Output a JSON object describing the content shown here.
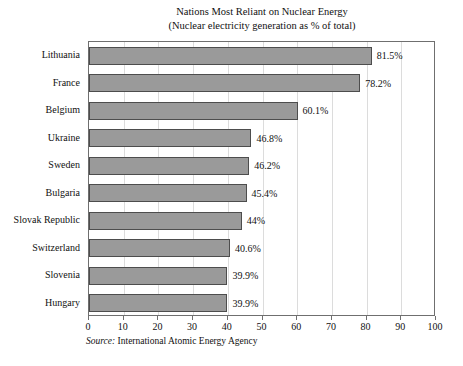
{
  "chart_data": {
    "type": "bar",
    "orientation": "horizontal",
    "title": "Nations Most Reliant on Nuclear Energy",
    "subtitle": "(Nuclear electricity generation as % of total)",
    "xlabel": "",
    "ylabel": "",
    "xlim": [
      0,
      100
    ],
    "xticks": [
      "0",
      "10",
      "20",
      "30",
      "40",
      "50",
      "60",
      "70",
      "80",
      "90",
      "100"
    ],
    "grid": true,
    "grid_axis": "x",
    "legend": false,
    "bar_color": "#9a9a9a",
    "bar_border_color": "#4d4d4d",
    "categories": [
      "Lithuania",
      "France",
      "Belgium",
      "Ukraine",
      "Sweden",
      "Bulgaria",
      "Slovak Republic",
      "Switzerland",
      "Slovenia",
      "Hungary"
    ],
    "values": [
      81.5,
      78.2,
      60.1,
      46.8,
      46.2,
      45.4,
      44,
      40.6,
      39.9,
      39.9
    ],
    "data_labels": [
      "81.5%",
      "78.2%",
      "60.1%",
      "46.8%",
      "46.2%",
      "45.4%",
      "44%",
      "40.6%",
      "39.9%",
      "39.9%"
    ],
    "source_label": "Source:",
    "source_text": "International Atomic Energy Agency"
  }
}
